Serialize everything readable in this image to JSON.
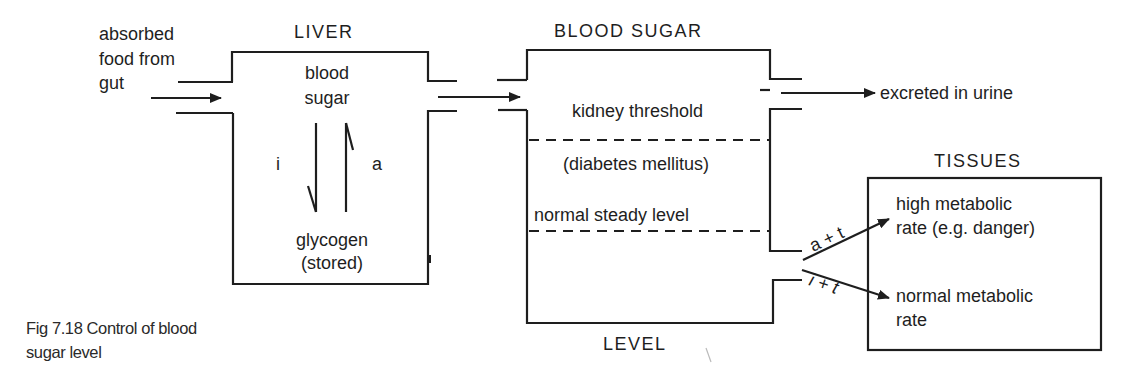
{
  "liver": {
    "title": "LIVER",
    "top_text": [
      "blood",
      "sugar"
    ],
    "bottom_text": [
      "glycogen",
      "(stored)"
    ],
    "arrow_down_label": "i",
    "arrow_up_label": "a"
  },
  "input": {
    "label": [
      "absorbed",
      "food from",
      "gut"
    ]
  },
  "blood_sugar": {
    "title": "BLOOD SUGAR",
    "bottom_title": "LEVEL",
    "kidney_threshold": "kidney threshold",
    "diabetes": "(diabetes mellitus)",
    "normal_level": "normal steady level"
  },
  "output": {
    "excreted": "excreted in urine"
  },
  "tissues": {
    "title": "TISSUES",
    "high_rate": [
      "high metabolic",
      "rate (e.g. danger)"
    ],
    "normal_rate": [
      "normal metabolic",
      "rate"
    ],
    "upper_arrow_label": "a + t",
    "lower_arrow_label": "i + t"
  },
  "caption": {
    "lines": [
      "Fig 7.18  Control of blood",
      "sugar level"
    ]
  }
}
